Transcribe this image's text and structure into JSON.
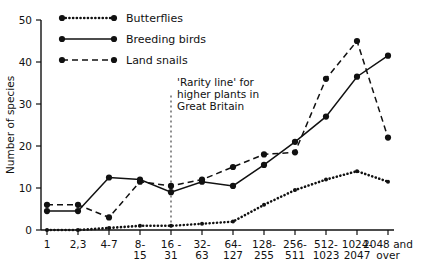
{
  "chart_data": {
    "type": "line",
    "title": "",
    "xlabel": "",
    "ylabel": "Number of species",
    "ylim": [
      0,
      50
    ],
    "yticks": [
      0,
      10,
      20,
      30,
      40,
      50
    ],
    "grid": false,
    "legend_position": "top-left",
    "categories": [
      "1",
      "2,3",
      "4-7",
      "8-15",
      "16-31",
      "32-63",
      "64-127",
      "128-255",
      "256-511",
      "512-1023",
      "1024-2047",
      "2048 and over"
    ],
    "category_lines": [
      [
        "1"
      ],
      [
        "2,3"
      ],
      [
        "4-7"
      ],
      [
        "8-",
        "15"
      ],
      [
        "16 -",
        "31"
      ],
      [
        "32-",
        "63"
      ],
      [
        "64-",
        "127"
      ],
      [
        "128-",
        "255"
      ],
      [
        "256-",
        "511"
      ],
      [
        "512-",
        "1023"
      ],
      [
        "1024-",
        "2047"
      ],
      [
        "2048 and",
        "over"
      ]
    ],
    "series": [
      {
        "name": "Butterflies",
        "style": "dotted",
        "values": [
          0,
          0,
          0.5,
          1,
          1,
          1.5,
          2,
          6,
          9.5,
          12,
          14,
          11.5
        ]
      },
      {
        "name": "Breeding birds",
        "style": "solid",
        "values": [
          4.5,
          4.5,
          12.5,
          12,
          9,
          11.5,
          10.5,
          15.5,
          21,
          27,
          36.5,
          41.5
        ]
      },
      {
        "name": "Land snails",
        "style": "dashed",
        "values": [
          6,
          6,
          3,
          11.5,
          10.5,
          12,
          15,
          18,
          18.5,
          36,
          45,
          22
        ]
      }
    ],
    "annotations": [
      {
        "name": "rarity-line",
        "lines": [
          "'Rarity line' for",
          "higher plants in",
          "Great Britain"
        ],
        "at_category_index": 4,
        "style": "vertical-dotted"
      }
    ]
  },
  "legend": {
    "items": [
      {
        "label": "Butterflies",
        "style": "dotted"
      },
      {
        "label": "Breeding birds",
        "style": "solid"
      },
      {
        "label": "Land snails",
        "style": "dashed"
      }
    ]
  }
}
